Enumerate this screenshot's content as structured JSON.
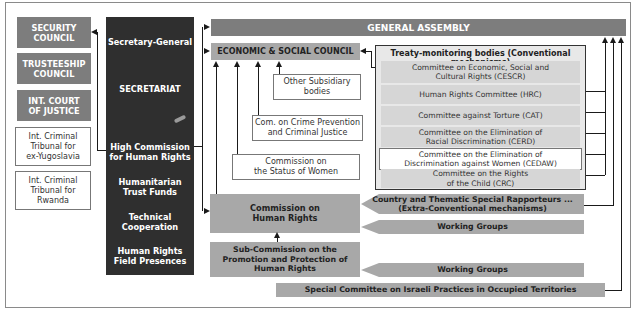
{
  "left_column": {
    "security_council": "SECURITY\nCOUNCIL",
    "trusteeship_council": "TRUSTEESHIP\nCOUNCIL",
    "icj": "INT. COURT\nOF JUSTICE",
    "icty": "Int. Criminal\nTribunal for\nex-Yugoslavia",
    "ictr": "Int. Criminal\nTribunal for\nRwanda"
  },
  "secretariat": {
    "secretary_general": "Secretary-General",
    "secretariat": "SECRETARIAT",
    "high_commission": "High Commission\nfor Human Rights",
    "humanitarian_trust_funds": "Humanitarian\nTrust Funds",
    "technical_cooperation": "Technical\nCooperation",
    "field_presences": "Human Rights\nField Presences"
  },
  "general_assembly": "GENERAL ASSEMBLY",
  "ecosoc": "ECONOMIC & SOCIAL COUNCIL",
  "subsidiary": {
    "other": "Other Subsidiary\nbodies",
    "crime": "Com. on Crime Prevention\nand Criminal Justice",
    "women": "Commission on\nthe Status of Women"
  },
  "treaty_bodies": {
    "title": "Treaty-monitoring bodies (Conventional mechanisms)",
    "items": [
      "Committee on Economic, Social and\nCultural Rights (CESCR)",
      "Human Rights Committee (HRC)",
      "Committee against Torture (CAT)",
      "Committee on the Elimination of\nRacial Discrimination (CERD)",
      "Committee on the Elimination of\nDiscrimination against Women (CEDAW)",
      "Committee on the Rights\nof the Child (CRC)"
    ]
  },
  "commission_hr": "Commission on\nHuman Rights",
  "sub_commission": "Sub-Commission on the\nPromotion and Protection of\nHuman Rights",
  "rapporteurs": "Country and Thematic Special Rapporteurs ...\n(Extra-Conventional mechanisms)",
  "working_groups_1": "Working Groups",
  "working_groups_2": "Working Groups",
  "special_committee": "Special Committee on Israeli Practices in Occupied Territories",
  "colors": {
    "dark_gray": "#7d7d7d",
    "secretariat_bg": "#2f2f2f",
    "light_gray": "#a8a8a8",
    "treaty_item_bg": "#d6d6d6"
  }
}
